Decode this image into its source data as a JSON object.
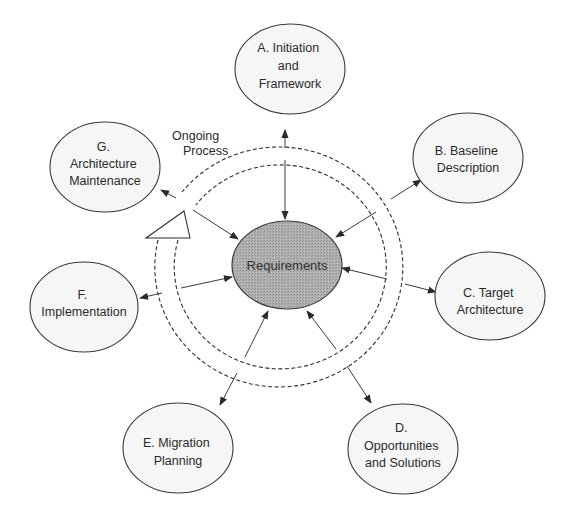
{
  "diagram": {
    "center": {
      "label": "Requirements"
    },
    "ongoing": {
      "line1": "Ongoing",
      "line2": "Process"
    },
    "nodes": [
      {
        "id": "A",
        "lines": [
          "A. Initiation",
          "and",
          "Framework"
        ]
      },
      {
        "id": "B",
        "lines": [
          "B. Baseline",
          "Description"
        ]
      },
      {
        "id": "C",
        "lines": [
          "C. Target",
          "Architecture"
        ]
      },
      {
        "id": "D",
        "lines": [
          "D.",
          "Opportunities",
          "and Solutions"
        ]
      },
      {
        "id": "E",
        "lines": [
          "E. Migration",
          "Planning"
        ]
      },
      {
        "id": "F",
        "lines": [
          "F.",
          "Implementation"
        ]
      },
      {
        "id": "G",
        "lines": [
          "G.",
          "Architecture",
          "Maintenance"
        ]
      }
    ],
    "colors": {
      "center_fill": "#a9a9a9",
      "node_fill": "#f6f6f6",
      "stroke": "#3a3a3a"
    }
  }
}
